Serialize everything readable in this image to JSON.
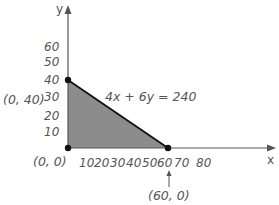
{
  "diagram": {
    "title": "",
    "equation": "4x + 6y = 240",
    "axes": {
      "x_label": "x",
      "y_label": "y",
      "x_ticks": [
        "10",
        "20",
        "30",
        "40",
        "50",
        "60",
        "70",
        "80"
      ],
      "y_ticks": [
        "10",
        "20",
        "30",
        "40",
        "50",
        "60"
      ]
    },
    "points": [
      {
        "label": "(0, 40)",
        "x": 0,
        "y": 40
      },
      {
        "label": "(0, 0)",
        "x": 0,
        "y": 0
      },
      {
        "label": "(60, 0)",
        "x": 60,
        "y": 0
      }
    ],
    "region": {
      "vertices": [
        [
          0,
          0
        ],
        [
          0,
          40
        ],
        [
          60,
          0
        ]
      ],
      "fill_color": "#8c8c8c"
    },
    "colors": {
      "axis": "#555555",
      "line": "#111111",
      "text": "#555555"
    }
  }
}
